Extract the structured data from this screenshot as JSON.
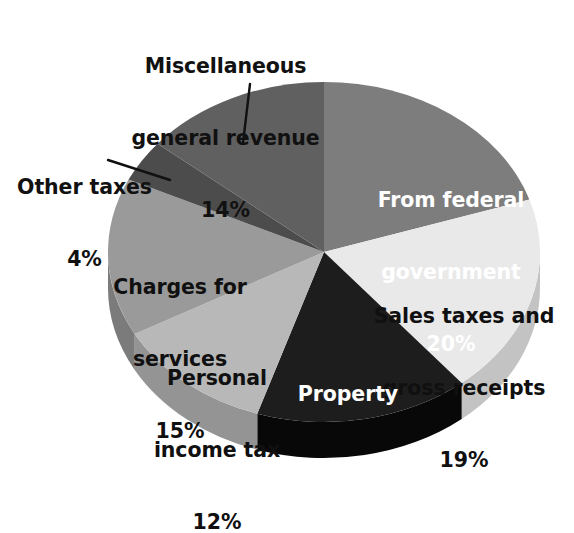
{
  "chart_data": {
    "type": "pie",
    "title": "",
    "subtitle": "",
    "xlabel": "",
    "ylabel": "",
    "units": "percent",
    "legend_position": "none",
    "grid": false,
    "start_angle_deg": 0,
    "direction": "clockwise",
    "three_d": true,
    "categories": [
      "From federal government",
      "Sales taxes and gross receipts",
      "Property taxes",
      "Personal income tax",
      "Charges for services",
      "Other taxes",
      "Miscellaneous general revenue"
    ],
    "values": [
      20,
      19,
      16,
      12,
      15,
      4,
      14
    ],
    "slices": [
      {
        "id": "from-federal-government",
        "name_line1": "From federal",
        "name_line2": "government",
        "value_label": "20%",
        "value": 20,
        "color": "#7d7d7d",
        "side_color": "#5d5d5d",
        "label_placement": "inside",
        "label_text_color": "#ffffff"
      },
      {
        "id": "sales-taxes-and-gross-receipts",
        "name_line1": "Sales taxes and",
        "name_line2": "gross receipts",
        "value_label": "19%",
        "value": 19,
        "color": "#e9e9e9",
        "side_color": "#c3c3c3",
        "label_placement": "inside",
        "label_text_color": "#101010"
      },
      {
        "id": "property-taxes",
        "name_line1": "Property",
        "name_line2": "taxes",
        "value_label": "16%",
        "value": 16,
        "color": "#1d1d1d",
        "side_color": "#080808",
        "label_placement": "inside",
        "label_text_color": "#ffffff"
      },
      {
        "id": "personal-income-tax",
        "name_line1": "Personal",
        "name_line2": "income tax",
        "value_label": "12%",
        "value": 12,
        "color": "#b8b8b8",
        "side_color": "#949494",
        "label_placement": "inside",
        "label_text_color": "#101010"
      },
      {
        "id": "charges-for-services",
        "name_line1": "Charges for",
        "name_line2": "services",
        "value_label": "15%",
        "value": 15,
        "color": "#9a9a9a",
        "side_color": "#7b7b7b",
        "label_placement": "inside",
        "label_text_color": "#101010"
      },
      {
        "id": "other-taxes",
        "name_line1": "Other taxes",
        "name_line2": "",
        "value_label": "4%",
        "value": 4,
        "color": "#4c4c4c",
        "side_color": "#3a3a3a",
        "label_placement": "outside-callout",
        "label_text_color": "#111111"
      },
      {
        "id": "miscellaneous-general-revenue",
        "name_line1": "Miscellaneous",
        "name_line2": "general revenue",
        "value_label": "14%",
        "value": 14,
        "color": "#606060",
        "side_color": "#4a4a4a",
        "label_placement": "outside-callout",
        "label_text_color": "#111111"
      }
    ]
  },
  "colors": {
    "background": "#ffffff",
    "callout_line": "#111111",
    "label_dark": "#111111",
    "label_light": "#ffffff"
  }
}
